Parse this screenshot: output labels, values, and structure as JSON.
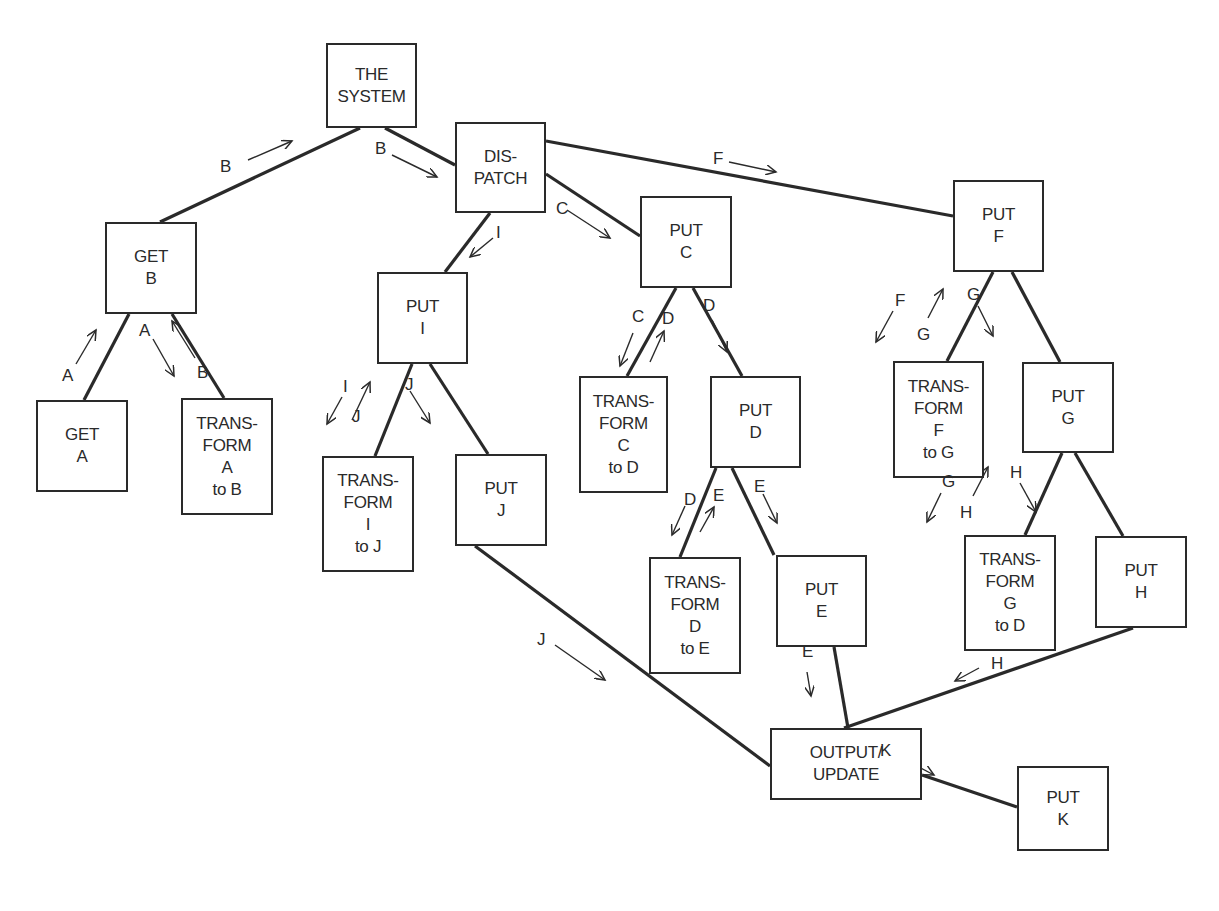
{
  "diagram": {
    "type": "system-structure-tree",
    "nodes": [
      {
        "id": "system",
        "lines": [
          "THE",
          "SYSTEM"
        ],
        "x": 326,
        "y": 43,
        "w": 91,
        "h": 85
      },
      {
        "id": "dispatch",
        "lines": [
          "DIS-",
          "PATCH"
        ],
        "x": 455,
        "y": 122,
        "w": 91,
        "h": 91
      },
      {
        "id": "get_b",
        "lines": [
          "GET",
          "B"
        ],
        "x": 105,
        "y": 222,
        "w": 92,
        "h": 92
      },
      {
        "id": "get_a",
        "lines": [
          "GET",
          "A"
        ],
        "x": 36,
        "y": 400,
        "w": 92,
        "h": 92
      },
      {
        "id": "transform_a_b",
        "lines": [
          "TRANS-",
          "FORM",
          "A",
          "to B"
        ],
        "x": 181,
        "y": 398,
        "w": 92,
        "h": 117
      },
      {
        "id": "put_i",
        "lines": [
          "PUT",
          "I"
        ],
        "x": 377,
        "y": 272,
        "w": 91,
        "h": 92
      },
      {
        "id": "transform_i_j",
        "lines": [
          "TRANS-",
          "FORM",
          "I",
          "to J"
        ],
        "x": 322,
        "y": 456,
        "w": 92,
        "h": 116
      },
      {
        "id": "put_j",
        "lines": [
          "PUT",
          "J"
        ],
        "x": 455,
        "y": 454,
        "w": 92,
        "h": 92
      },
      {
        "id": "put_c",
        "lines": [
          "PUT",
          "C"
        ],
        "x": 640,
        "y": 196,
        "w": 92,
        "h": 92
      },
      {
        "id": "transform_c_d",
        "lines": [
          "TRANS-",
          "FORM",
          "C",
          "to D"
        ],
        "x": 579,
        "y": 376,
        "w": 89,
        "h": 117
      },
      {
        "id": "put_d",
        "lines": [
          "PUT",
          "D"
        ],
        "x": 710,
        "y": 376,
        "w": 91,
        "h": 92
      },
      {
        "id": "transform_d_e",
        "lines": [
          "TRANS-",
          "FORM",
          "D",
          "to E"
        ],
        "x": 649,
        "y": 557,
        "w": 92,
        "h": 117
      },
      {
        "id": "put_e",
        "lines": [
          "PUT",
          "E"
        ],
        "x": 776,
        "y": 555,
        "w": 91,
        "h": 92
      },
      {
        "id": "put_f",
        "lines": [
          "PUT",
          "F"
        ],
        "x": 953,
        "y": 180,
        "w": 91,
        "h": 92
      },
      {
        "id": "transform_f_g",
        "lines": [
          "TRANS-",
          "FORM",
          "F",
          "to G"
        ],
        "x": 893,
        "y": 361,
        "w": 91,
        "h": 117
      },
      {
        "id": "put_g",
        "lines": [
          "PUT",
          "G"
        ],
        "x": 1022,
        "y": 362,
        "w": 92,
        "h": 91
      },
      {
        "id": "transform_g_d",
        "lines": [
          "TRANS-",
          "FORM",
          "G",
          "to D"
        ],
        "x": 964,
        "y": 535,
        "w": 92,
        "h": 116
      },
      {
        "id": "put_h",
        "lines": [
          "PUT",
          "H"
        ],
        "x": 1095,
        "y": 536,
        "w": 92,
        "h": 92
      },
      {
        "id": "output_update",
        "lines": [
          "OUTPUT/",
          "UPDATE"
        ],
        "x": 770,
        "y": 728,
        "w": 152,
        "h": 72
      },
      {
        "id": "put_k",
        "lines": [
          "PUT",
          "K"
        ],
        "x": 1017,
        "y": 766,
        "w": 92,
        "h": 85
      }
    ],
    "edges": [
      {
        "from": "system",
        "to": "get_b",
        "x1": 360,
        "y1": 128,
        "x2": 160,
        "y2": 222
      },
      {
        "from": "system",
        "to": "dispatch",
        "x1": 385,
        "y1": 128,
        "x2": 455,
        "y2": 165
      },
      {
        "from": "dispatch",
        "to": "put_f",
        "x1": 546,
        "y1": 141,
        "x2": 953,
        "y2": 216
      },
      {
        "from": "dispatch",
        "to": "put_c",
        "x1": 546,
        "y1": 174,
        "x2": 640,
        "y2": 236
      },
      {
        "from": "dispatch",
        "to": "put_i",
        "x1": 490,
        "y1": 213,
        "x2": 445,
        "y2": 272
      },
      {
        "from": "get_b",
        "to": "get_a",
        "x1": 129,
        "y1": 314,
        "x2": 84,
        "y2": 400
      },
      {
        "from": "get_b",
        "to": "transform_a_b",
        "x1": 172,
        "y1": 314,
        "x2": 224,
        "y2": 398
      },
      {
        "from": "put_i",
        "to": "transform_i_j",
        "x1": 412,
        "y1": 364,
        "x2": 375,
        "y2": 456
      },
      {
        "from": "put_i",
        "to": "put_j",
        "x1": 430,
        "y1": 364,
        "x2": 488,
        "y2": 454
      },
      {
        "from": "put_c",
        "to": "transform_c_d",
        "x1": 676,
        "y1": 288,
        "x2": 627,
        "y2": 376
      },
      {
        "from": "put_c",
        "to": "put_d",
        "x1": 693,
        "y1": 288,
        "x2": 742,
        "y2": 376
      },
      {
        "from": "put_d",
        "to": "transform_d_e",
        "x1": 716,
        "y1": 468,
        "x2": 680,
        "y2": 557
      },
      {
        "from": "put_d",
        "to": "put_e",
        "x1": 732,
        "y1": 468,
        "x2": 774,
        "y2": 555
      },
      {
        "from": "put_f",
        "to": "transform_f_g",
        "x1": 993,
        "y1": 272,
        "x2": 947,
        "y2": 361
      },
      {
        "from": "put_f",
        "to": "put_g",
        "x1": 1012,
        "y1": 272,
        "x2": 1060,
        "y2": 362
      },
      {
        "from": "put_g",
        "to": "transform_g_d",
        "x1": 1062,
        "y1": 453,
        "x2": 1025,
        "y2": 535
      },
      {
        "from": "put_g",
        "to": "put_h",
        "x1": 1075,
        "y1": 453,
        "x2": 1123,
        "y2": 536
      },
      {
        "from": "put_j",
        "to": "output_update",
        "x1": 475,
        "y1": 546,
        "x2": 770,
        "y2": 766
      },
      {
        "from": "put_e",
        "to": "output_update",
        "x1": 834,
        "y1": 647,
        "x2": 848,
        "y2": 728
      },
      {
        "from": "put_h",
        "to": "output_update",
        "x1": 1133,
        "y1": 628,
        "x2": 844,
        "y2": 728
      },
      {
        "from": "output_update",
        "to": "put_k",
        "x1": 922,
        "y1": 775,
        "x2": 1017,
        "y2": 807
      }
    ],
    "flow_labels": [
      {
        "text": "B",
        "x": 220,
        "y": 158,
        "ax1": 248,
        "ay1": 160,
        "ax2": 292,
        "ay2": 141
      },
      {
        "text": "B",
        "x": 375,
        "y": 140,
        "ax1": 392,
        "ay1": 155,
        "ax2": 437,
        "ay2": 177
      },
      {
        "text": "F",
        "x": 713,
        "y": 150,
        "ax1": 729,
        "ay1": 162,
        "ax2": 776,
        "ay2": 172
      },
      {
        "text": "C",
        "x": 556,
        "y": 200,
        "ax1": 567,
        "ay1": 210,
        "ax2": 610,
        "ay2": 238
      },
      {
        "text": "I",
        "x": 496,
        "y": 224,
        "ax1": 493,
        "ay1": 238,
        "ax2": 470,
        "ay2": 257
      },
      {
        "text": "A",
        "x": 62,
        "y": 367,
        "ax1": 76,
        "ay1": 364,
        "ax2": 96,
        "ay2": 330
      },
      {
        "text": "A",
        "x": 139,
        "y": 322,
        "ax1": 153,
        "ay1": 339,
        "ax2": 174,
        "ay2": 376
      },
      {
        "text": "B",
        "x": 197,
        "y": 364,
        "ax1": 195,
        "ay1": 358,
        "ax2": 172,
        "ay2": 321
      },
      {
        "text": "I",
        "x": 343,
        "y": 378,
        "ax1": 342,
        "ay1": 397,
        "ax2": 327,
        "ay2": 424
      },
      {
        "text": "J",
        "x": 352,
        "y": 408,
        "ax1": 352,
        "ay1": 420,
        "ax2": 370,
        "ay2": 382
      },
      {
        "text": "J",
        "x": 405,
        "y": 376,
        "ax1": 410,
        "ay1": 391,
        "ax2": 430,
        "ay2": 423
      },
      {
        "text": "C",
        "x": 632,
        "y": 308,
        "ax1": 633,
        "ay1": 333,
        "ax2": 620,
        "ay2": 366
      },
      {
        "text": "D",
        "x": 662,
        "y": 310,
        "ax1": 650,
        "ay1": 362,
        "ax2": 664,
        "ay2": 331
      },
      {
        "text": "D",
        "x": 703,
        "y": 297,
        "ax1": 712,
        "ay1": 320,
        "ax2": 727,
        "ay2": 352
      },
      {
        "text": "F",
        "x": 895,
        "y": 292,
        "ax1": 893,
        "ay1": 311,
        "ax2": 876,
        "ay2": 342
      },
      {
        "text": "G",
        "x": 917,
        "y": 326,
        "ax1": 928,
        "ay1": 318,
        "ax2": 943,
        "ay2": 289
      },
      {
        "text": "G",
        "x": 967,
        "y": 286,
        "ax1": 978,
        "ay1": 306,
        "ax2": 993,
        "ay2": 336
      },
      {
        "text": "D",
        "x": 684,
        "y": 491,
        "ax1": 685,
        "ay1": 506,
        "ax2": 672,
        "ay2": 535
      },
      {
        "text": "E",
        "x": 713,
        "y": 487,
        "ax1": 700,
        "ay1": 532,
        "ax2": 714,
        "ay2": 507
      },
      {
        "text": "E",
        "x": 754,
        "y": 478,
        "ax1": 763,
        "ay1": 494,
        "ax2": 777,
        "ay2": 523
      },
      {
        "text": "G",
        "x": 942,
        "y": 473,
        "ax1": 941,
        "ay1": 493,
        "ax2": 927,
        "ay2": 522
      },
      {
        "text": "H",
        "x": 960,
        "y": 504,
        "ax1": 973,
        "ay1": 496,
        "ax2": 988,
        "ay2": 467
      },
      {
        "text": "H",
        "x": 1010,
        "y": 464,
        "ax1": 1020,
        "ay1": 483,
        "ax2": 1036,
        "ay2": 512
      },
      {
        "text": "J",
        "x": 537,
        "y": 631,
        "ax1": 555,
        "ay1": 645,
        "ax2": 605,
        "ay2": 680
      },
      {
        "text": "E",
        "x": 802,
        "y": 643,
        "ax1": 807,
        "ay1": 672,
        "ax2": 811,
        "ay2": 696
      },
      {
        "text": "H",
        "x": 991,
        "y": 655,
        "ax1": 979,
        "ay1": 668,
        "ax2": 955,
        "ay2": 681
      },
      {
        "text": "K",
        "x": 880,
        "y": 742,
        "ax1": 896,
        "ay1": 755,
        "ax2": 934,
        "ay2": 775
      }
    ]
  }
}
